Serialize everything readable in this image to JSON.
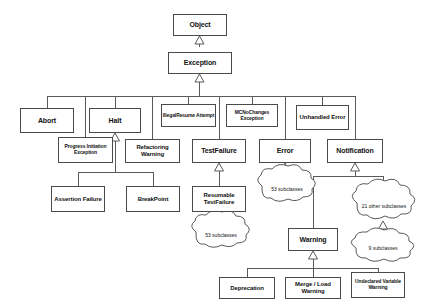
{
  "diagram": {
    "type": "uml-class-hierarchy",
    "canvas": {
      "width": 446,
      "height": 308
    },
    "colors": {
      "background": "#ffffff",
      "box_border": "#4a4a4a",
      "connector": "#5a5a5a",
      "text": "#111111"
    }
  },
  "nodes": {
    "object": "Object",
    "exception": "Exception",
    "abort": "Abort",
    "halt": "Halt",
    "illegal_resume_attempt": "IllegalResume Attempt",
    "mc_no_changes_exception": "MCNoChanges Exception",
    "unhandled_error": "Unhandled Error",
    "progress_initiation_exception": "Progress Initiation Exception",
    "refactoring_warning": "Refactoring Warning",
    "test_failure": "TestFailure",
    "error": "Error",
    "notification": "Notification",
    "assertion_failure": "Assertion Failure",
    "breakpoint": "BreakPoint",
    "resumable_test_failure": "Resumable TestFailure",
    "warning": "Warning",
    "deprecation": "Deprecation",
    "merge_load_warning": "Merge / Load Warning",
    "undeclared_variable_warning": "Undeclared Variable Warning"
  },
  "clouds": {
    "error_subclasses": "53 subclasses",
    "notification_subclasses": "21 other subclasses",
    "error_lower_subclasses": "53 subclasses",
    "warning_subclasses": "9 subclasses"
  },
  "relations": [
    {
      "child": "exception",
      "parent": "object",
      "kind": "generalization"
    },
    {
      "child": "abort",
      "parent": "exception",
      "kind": "generalization"
    },
    {
      "child": "halt",
      "parent": "exception",
      "kind": "generalization"
    },
    {
      "child": "illegal_resume_attempt",
      "parent": "exception",
      "kind": "generalization"
    },
    {
      "child": "mc_no_changes_exception",
      "parent": "exception",
      "kind": "generalization"
    },
    {
      "child": "unhandled_error",
      "parent": "exception",
      "kind": "generalization"
    },
    {
      "child": "progress_initiation_exception",
      "parent": "exception",
      "kind": "generalization"
    },
    {
      "child": "refactoring_warning",
      "parent": "exception",
      "kind": "generalization"
    },
    {
      "child": "test_failure",
      "parent": "exception",
      "kind": "generalization"
    },
    {
      "child": "error",
      "parent": "exception",
      "kind": "generalization"
    },
    {
      "child": "notification",
      "parent": "exception",
      "kind": "generalization"
    },
    {
      "child": "assertion_failure",
      "parent": "halt",
      "kind": "generalization"
    },
    {
      "child": "breakpoint",
      "parent": "halt",
      "kind": "generalization"
    },
    {
      "child": "resumable_test_failure",
      "parent": "test_failure",
      "kind": "generalization"
    },
    {
      "child": "error_subclasses",
      "parent": "error",
      "kind": "generalization"
    },
    {
      "child": "error_lower_subclasses",
      "parent": "error_subclasses",
      "kind": "generalization"
    },
    {
      "child": "warning",
      "parent": "notification",
      "kind": "generalization"
    },
    {
      "child": "notification_subclasses",
      "parent": "notification",
      "kind": "generalization"
    },
    {
      "child": "warning_subclasses",
      "parent": "notification_subclasses",
      "kind": "generalization"
    },
    {
      "child": "deprecation",
      "parent": "warning",
      "kind": "generalization"
    },
    {
      "child": "merge_load_warning",
      "parent": "warning",
      "kind": "generalization"
    },
    {
      "child": "undeclared_variable_warning",
      "parent": "warning",
      "kind": "generalization"
    }
  ]
}
